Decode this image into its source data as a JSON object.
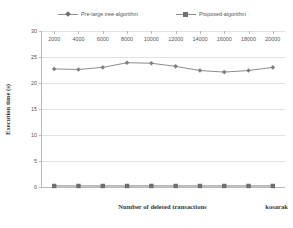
{
  "chart_data": {
    "type": "line",
    "title": "",
    "xlabel": "Number of deleted transactions",
    "ylabel": "Execution time (s)",
    "dataset_label": "kosarak",
    "x": [
      2000,
      4000,
      6000,
      8000,
      10000,
      12000,
      14000,
      16000,
      18000,
      20000
    ],
    "xtick_labels": [
      "2000",
      "4000",
      "6000",
      "8000",
      "10000",
      "12000",
      "14000",
      "16000",
      "18000",
      "20000"
    ],
    "ytick_labels": [
      "0",
      "5",
      "10",
      "15",
      "20",
      "25",
      "30"
    ],
    "yticks": [
      0,
      5,
      10,
      15,
      20,
      25,
      30
    ],
    "ylim": [
      0,
      30
    ],
    "grid": "horizontal",
    "legend_position": "top",
    "series": [
      {
        "name": "Pre-large tree-algorithm",
        "marker": "diamond",
        "color": "#7f7f7f",
        "values": [
          22.7,
          22.6,
          23.0,
          23.9,
          23.8,
          23.2,
          22.4,
          22.1,
          22.4,
          23.0
        ]
      },
      {
        "name": "Proposed-algorithm",
        "marker": "square",
        "color": "#6e6e6e",
        "values": [
          0.2,
          0.2,
          0.2,
          0.2,
          0.2,
          0.2,
          0.2,
          0.2,
          0.2,
          0.2
        ]
      }
    ]
  },
  "legend": {
    "entries": [
      {
        "label": "Pre-large tree-algorithm",
        "marker": "diamond"
      },
      {
        "label": "Proposed-algorithm",
        "marker": "square"
      }
    ]
  },
  "axes": {
    "xlabel": "Number of deleted transactions",
    "ylabel": "Execution time (s)",
    "dataset_label": "kosarak"
  }
}
